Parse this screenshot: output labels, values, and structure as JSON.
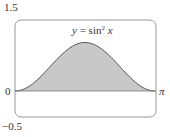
{
  "chart_data": {
    "type": "area",
    "title_parts": {
      "lhs": "y",
      "eq": " = sin",
      "exp": "2",
      "var": " x"
    },
    "function": "sin^2(x)",
    "xlabel": "",
    "ylabel": "",
    "x_tick_labels": [
      "0",
      "π"
    ],
    "y_tick_labels": [
      "1.5",
      "0",
      "−0.5"
    ],
    "xlim": [
      0,
      3.14159
    ],
    "ylim": [
      -0.5,
      1.5
    ],
    "grid": false,
    "legend": null,
    "x": [
      0,
      0.3927,
      0.7854,
      1.1781,
      1.5708,
      1.9635,
      2.3562,
      2.7489,
      3.14159
    ],
    "y": [
      0,
      0.1464,
      0.5,
      0.8536,
      1.0,
      0.8536,
      0.5,
      0.1464,
      0
    ],
    "fill_color": "#c8c8c8",
    "line_color": "#555555",
    "frame_color": "#999999"
  },
  "labels": {
    "y_top": "1.5",
    "y_zero": "0",
    "y_bottom": "−0.5",
    "x_right": "π"
  }
}
